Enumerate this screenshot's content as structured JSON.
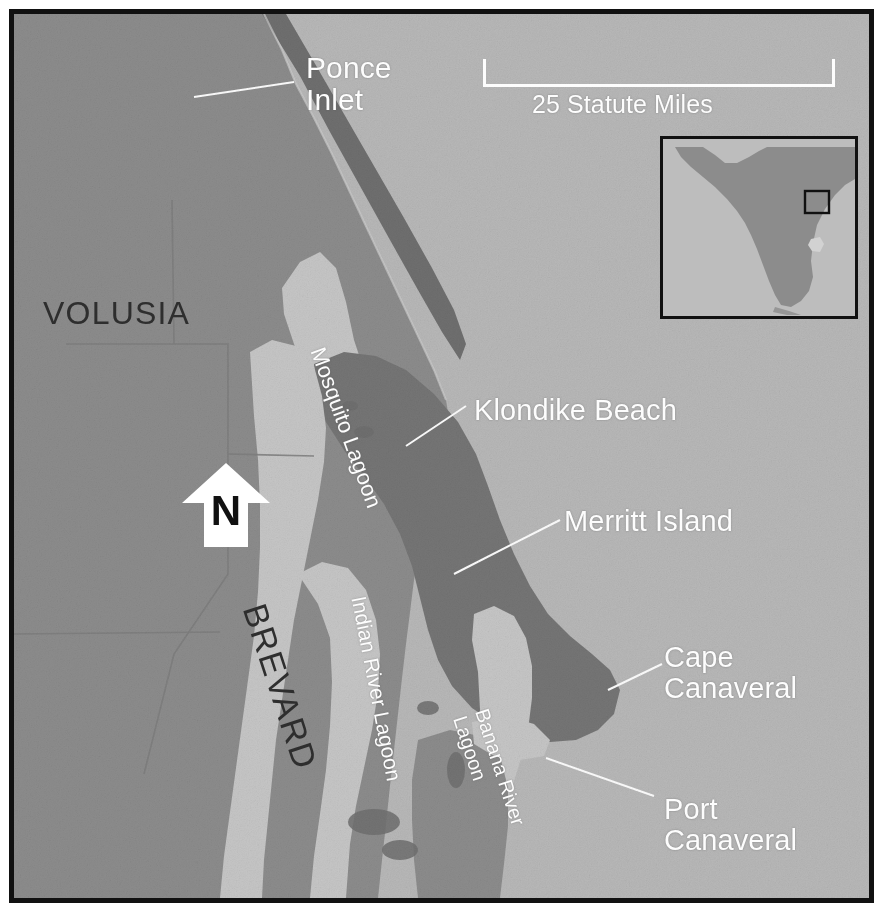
{
  "figure": {
    "kind": "reference-locator-map",
    "region": "Florida Atlantic coast — Volusia and Brevard counties",
    "frame_color": "#111111",
    "background_color": "#ffffff"
  },
  "palette": {
    "ocean": "#b8b8b8",
    "lagoon": "#c6c6c6",
    "mainland": "#8c8c8c",
    "island_dark": "#757575",
    "barrier_dark": "#6f6f6f",
    "label_white": "#fdfdfd",
    "label_dark": "#2e2e2e",
    "frame": "#111111",
    "inset_land": "#8c8c8c",
    "inset_water": "#bdbdbd"
  },
  "scale_bar": {
    "label": "25 Statute Miles"
  },
  "north_arrow": {
    "letter": "N",
    "direction": "up"
  },
  "inset": {
    "locator_box_visible": true,
    "state_outline": "Florida peninsula"
  },
  "county_labels": [
    {
      "name": "volusia",
      "text": "VOLUSIA",
      "style": "dark-upright"
    },
    {
      "name": "brevard",
      "text": "BREVARD",
      "style": "dark-rotated"
    }
  ],
  "water_labels": [
    {
      "name": "mosquito-lagoon",
      "text": "Mosquito Lagoon"
    },
    {
      "name": "indian-river-lagoon",
      "text": "Indian River Lagoon"
    },
    {
      "name": "banana-river-lagoon",
      "line1": "Banana River",
      "line2": "Lagoon"
    }
  ],
  "place_labels": [
    {
      "name": "ponce-inlet",
      "line1": "Ponce",
      "line2": "Inlet",
      "has_leader": true
    },
    {
      "name": "klondike-beach",
      "text": "Klondike Beach",
      "has_leader": true
    },
    {
      "name": "merritt-island",
      "text": "Merritt Island",
      "has_leader": true
    },
    {
      "name": "cape-canaveral",
      "line1": "Cape",
      "line2": "Canaveral",
      "has_leader": true
    },
    {
      "name": "port-canaveral",
      "line1": "Port",
      "line2": "Canaveral",
      "has_leader": true
    }
  ]
}
